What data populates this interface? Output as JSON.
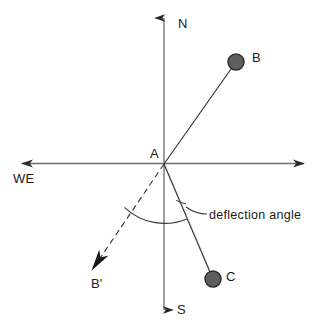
{
  "figure": {
    "background_color": "#ffffff",
    "line_color": "#3a3a3a",
    "text_color": "#1a1a1a",
    "marker_fill": "#5e5e5e",
    "marker_stroke": "#2b2b2b",
    "width": 324,
    "height": 335
  },
  "axes": {
    "origin_label": "A",
    "north_label": "N",
    "south_label": "S",
    "westeast_label": "WE",
    "origin": {
      "x": 164,
      "y": 164
    },
    "vertical": {
      "top": {
        "x": 164,
        "y": 13
      },
      "bottom": {
        "x": 164,
        "y": 315
      }
    },
    "horizontal": {
      "left": {
        "x": 17,
        "y": 163
      },
      "right": {
        "x": 309,
        "y": 163
      }
    }
  },
  "points": [
    {
      "name": "B",
      "label": "B",
      "x": 236,
      "y": 62,
      "radius": 8,
      "filled": true
    },
    {
      "name": "C",
      "label": "C",
      "x": 213,
      "y": 279,
      "radius": 8,
      "filled": true
    },
    {
      "name": "Bp",
      "label": "B'",
      "x": 86,
      "y": 279,
      "radius": 0,
      "filled": false
    }
  ],
  "lines": [
    {
      "name": "line-a-b",
      "from": "A",
      "to": "B",
      "style": "solid",
      "arrow": false
    },
    {
      "name": "line-a-c",
      "from": "A",
      "to": "C",
      "style": "solid",
      "arrow": false
    },
    {
      "name": "line-a-bp",
      "from": "A",
      "to": "B'",
      "style": "dashed",
      "arrow": true
    }
  ],
  "annotation": {
    "deflection_label": "deflection angle",
    "arc_radius": 58,
    "leader_from": {
      "x": 186,
      "y": 207
    },
    "leader_to": {
      "x": 207,
      "y": 214
    }
  },
  "watermarks": {
    "mark_one": "",
    "mark_two": ""
  }
}
